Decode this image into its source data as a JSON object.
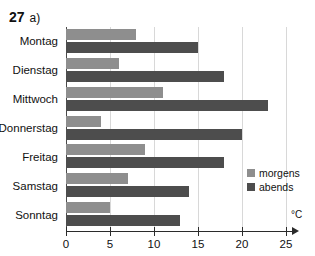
{
  "header": {
    "number": "27",
    "part": "a)"
  },
  "chart_data": {
    "type": "bar",
    "orientation": "horizontal",
    "title": "",
    "subtitle": "",
    "xlabel": "°C",
    "ylabel": "",
    "categories": [
      "Montag",
      "Dienstag",
      "Mittwoch",
      "Donnerstag",
      "Freitag",
      "Samstag",
      "Sonntag"
    ],
    "series": [
      {
        "name": "morgens",
        "color": "#8e8e8e",
        "values": [
          8,
          6,
          11,
          4,
          9,
          7,
          5
        ]
      },
      {
        "name": "abends",
        "color": "#4d4d4d",
        "values": [
          15,
          18,
          23,
          20,
          18,
          14,
          13
        ]
      }
    ],
    "xlim": [
      0,
      25
    ],
    "xticks": [
      0,
      5,
      10,
      15,
      20,
      25
    ],
    "xtick_labels": [
      "0",
      "5",
      "10",
      "15",
      "20",
      "25"
    ],
    "grid": true,
    "grid_axis": "x",
    "legend_position": "right-inside",
    "unit": "°C"
  }
}
